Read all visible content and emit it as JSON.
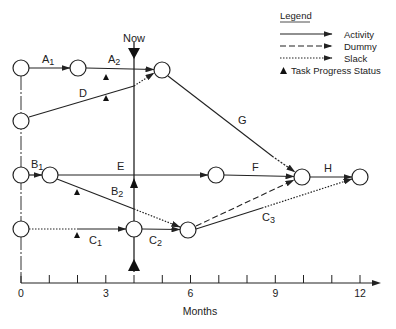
{
  "diagram": {
    "type": "network-schedule",
    "now_label": "Now",
    "now_month": 4,
    "legend": {
      "title": "Legend",
      "items": [
        {
          "style": "solid",
          "label": "Activity"
        },
        {
          "style": "dashed",
          "label": "Dummy"
        },
        {
          "style": "dotted",
          "label": "Slack"
        },
        {
          "style": "triangle",
          "label": "Task Progress Status"
        }
      ]
    },
    "activities": [
      {
        "id": "A1",
        "label": "A",
        "sub": "1"
      },
      {
        "id": "A2",
        "label": "A",
        "sub": "2"
      },
      {
        "id": "D",
        "label": "D",
        "sub": ""
      },
      {
        "id": "G",
        "label": "G",
        "sub": ""
      },
      {
        "id": "B1",
        "label": "B",
        "sub": "1"
      },
      {
        "id": "E",
        "label": "E",
        "sub": ""
      },
      {
        "id": "F",
        "label": "F",
        "sub": ""
      },
      {
        "id": "H",
        "label": "H",
        "sub": ""
      },
      {
        "id": "B2",
        "label": "B",
        "sub": "2"
      },
      {
        "id": "C1",
        "label": "C",
        "sub": "1"
      },
      {
        "id": "C2",
        "label": "C",
        "sub": "2"
      },
      {
        "id": "C3",
        "label": "C",
        "sub": "3"
      }
    ],
    "axis": {
      "label": "Months",
      "ticks": [
        "0",
        "3",
        "6",
        "9",
        "12"
      ],
      "min": 0,
      "max": 12
    }
  }
}
